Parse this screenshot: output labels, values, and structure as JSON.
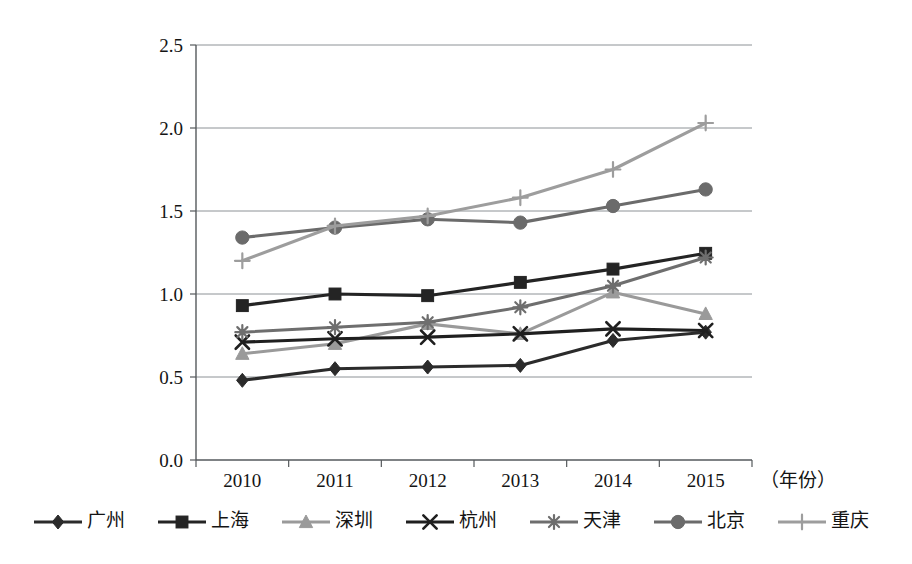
{
  "chart_data": {
    "type": "line",
    "title": "",
    "subtitle": "",
    "xlabel": "（年份）",
    "ylabel": "",
    "categories": [
      "2010",
      "2011",
      "2012",
      "2013",
      "2014",
      "2015"
    ],
    "x_unit_label": "（年份）",
    "ylim": [
      0.0,
      2.5
    ],
    "y_ticks": [
      "0.0",
      "0.5",
      "1.0",
      "1.5",
      "2.0",
      "2.5"
    ],
    "y_tick_values": [
      0.0,
      0.5,
      1.0,
      1.5,
      2.0,
      2.5
    ],
    "grid": "horizontal",
    "legend_position": "bottom",
    "series": [
      {
        "name": "广州",
        "marker": "diamond",
        "color": "#2b2b2b",
        "values": [
          0.48,
          0.55,
          0.56,
          0.57,
          0.72,
          0.77
        ]
      },
      {
        "name": "上海",
        "marker": "square",
        "color": "#242424",
        "values": [
          0.93,
          1.0,
          0.99,
          1.07,
          1.15,
          1.245
        ]
      },
      {
        "name": "深圳",
        "marker": "triangle",
        "color": "#9a9a9a",
        "values": [
          0.64,
          0.7,
          0.82,
          0.76,
          1.01,
          0.88
        ]
      },
      {
        "name": "杭州",
        "marker": "x",
        "color": "#1f1f1f",
        "values": [
          0.71,
          0.73,
          0.74,
          0.76,
          0.79,
          0.78
        ]
      },
      {
        "name": "天津",
        "marker": "asterisk",
        "color": "#6e6e6e",
        "values": [
          0.77,
          0.8,
          0.83,
          0.92,
          1.05,
          1.22
        ]
      },
      {
        "name": "北京",
        "marker": "circle",
        "color": "#6b6b6b",
        "values": [
          1.34,
          1.4,
          1.45,
          1.43,
          1.53,
          1.63
        ]
      },
      {
        "name": "重庆",
        "marker": "plus",
        "color": "#9d9d9d",
        "values": [
          1.2,
          1.41,
          1.47,
          1.58,
          1.75,
          2.03
        ]
      }
    ]
  },
  "legend": {
    "items": [
      {
        "label": "广州",
        "marker": "diamond",
        "color": "#2b2b2b"
      },
      {
        "label": "上海",
        "marker": "square",
        "color": "#242424"
      },
      {
        "label": "深圳",
        "marker": "triangle",
        "color": "#9a9a9a"
      },
      {
        "label": "杭州",
        "marker": "x",
        "color": "#1f1f1f"
      },
      {
        "label": "天津",
        "marker": "asterisk",
        "color": "#6e6e6e"
      },
      {
        "label": "北京",
        "marker": "circle",
        "color": "#6b6b6b"
      },
      {
        "label": "重庆",
        "marker": "plus",
        "color": "#9d9d9d"
      }
    ]
  },
  "colors": {
    "axis": "#55595c",
    "grid": "#8d9296",
    "text": "#141414",
    "background": "#ffffff"
  }
}
